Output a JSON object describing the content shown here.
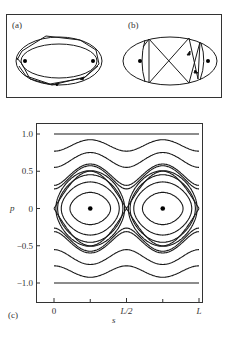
{
  "panels": {
    "a": {
      "label": "(a)"
    },
    "b": {
      "label": "(b)"
    },
    "c": {
      "label": "(c)"
    }
  },
  "chart_data": {
    "type": "line",
    "xlabel": "s",
    "ylabel": "p",
    "x_ticks": [
      "0",
      "L/2",
      "L"
    ],
    "y_ticks": [
      "1.0",
      "0.5",
      "0",
      "−0.5",
      "−1.0"
    ],
    "xlim": [
      0,
      1
    ],
    "ylim": [
      -1.0,
      1.0
    ],
    "grid": false,
    "elliptic_points": [
      {
        "s": 0.25,
        "p": 0
      },
      {
        "s": 0.75,
        "p": 0
      }
    ],
    "hyperbolic_points": [
      {
        "s": 0,
        "p": 0
      },
      {
        "s": 0.5,
        "p": 0
      },
      {
        "s": 1,
        "p": 0
      }
    ],
    "rotational_curves_p_mean": [
      1.0,
      0.82,
      0.62,
      0.42,
      0.25,
      -0.25,
      -0.42,
      -0.62,
      -0.82,
      -1.0
    ],
    "libration_curves_count_per_island": 4,
    "separatrix": true
  },
  "colors": {
    "ink": "#1a1a1a",
    "frame": "#333333",
    "background": "#ffffff"
  }
}
